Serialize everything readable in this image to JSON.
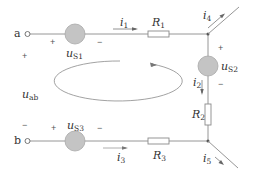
{
  "colors": {
    "wire": "#8a8a8a",
    "source_fill": "#c4c4c4",
    "source_stroke": "#a0a0a0",
    "text": "#333333",
    "node": "#555555"
  },
  "terminals": {
    "a": "a",
    "b": "b"
  },
  "voltage": {
    "label": "u",
    "sub": "ab",
    "plus": "+",
    "minus": "−"
  },
  "sources": [
    {
      "id": "us1",
      "label": "u",
      "sub": "S1",
      "plus": "+",
      "minus": "−"
    },
    {
      "id": "us2",
      "label": "u",
      "sub": "S2",
      "plus": "+",
      "minus": "−"
    },
    {
      "id": "us3",
      "label": "u",
      "sub": "S3",
      "plus": "+",
      "minus": "−"
    }
  ],
  "resistors": [
    {
      "id": "r1",
      "label": "R",
      "sub": "1"
    },
    {
      "id": "r2",
      "label": "R",
      "sub": "2"
    },
    {
      "id": "r3",
      "label": "R",
      "sub": "3"
    }
  ],
  "currents": [
    {
      "id": "i1",
      "label": "i",
      "sub": "1"
    },
    {
      "id": "i2",
      "label": "i",
      "sub": "2"
    },
    {
      "id": "i3",
      "label": "i",
      "sub": "3"
    },
    {
      "id": "i4",
      "label": "i",
      "sub": "4"
    },
    {
      "id": "i5",
      "label": "i",
      "sub": "5"
    }
  ],
  "loop": {
    "direction": "counterclockwise"
  }
}
